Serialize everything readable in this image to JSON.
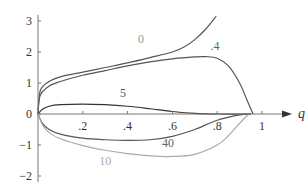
{
  "chart_data": {
    "type": "line",
    "title": "",
    "xlabel": "q",
    "ylabel": "",
    "xlim": [
      0,
      1.05
    ],
    "ylim": [
      -2.2,
      3.2
    ],
    "grid": false,
    "legend": "inline curve labels",
    "x_ticks": [
      ".2",
      ".4",
      ".6",
      ".8",
      "1"
    ],
    "y_ticks": [
      "3",
      "2",
      "1",
      "0",
      "−1",
      "−2"
    ],
    "series": [
      {
        "name": "0",
        "color": "#555555",
        "label_color": "#999999",
        "x": [
          0,
          0.01,
          0.05,
          0.1,
          0.2,
          0.3,
          0.4,
          0.5,
          0.6,
          0.65,
          0.7,
          0.75,
          0.8
        ],
        "y": [
          0,
          0.75,
          1.05,
          1.2,
          1.35,
          1.5,
          1.65,
          1.82,
          2.0,
          2.15,
          2.4,
          2.75,
          3.2
        ]
      },
      {
        "name": ".4",
        "color": "#555555",
        "label_color": "#666666",
        "x": [
          0,
          0.01,
          0.05,
          0.1,
          0.2,
          0.3,
          0.4,
          0.5,
          0.6,
          0.7,
          0.75,
          0.8,
          0.85,
          0.9,
          0.93,
          0.96
        ],
        "y": [
          0,
          0.6,
          0.9,
          1.05,
          1.25,
          1.4,
          1.55,
          1.68,
          1.78,
          1.84,
          1.85,
          1.8,
          1.55,
          1.0,
          0.5,
          0
        ]
      },
      {
        "name": "5",
        "color": "#333333",
        "label_color": "#555555",
        "x": [
          0,
          0.02,
          0.05,
          0.1,
          0.2,
          0.3,
          0.4,
          0.5,
          0.6,
          0.7,
          0.8,
          0.95
        ],
        "y": [
          0,
          0.15,
          0.25,
          0.3,
          0.32,
          0.3,
          0.25,
          0.17,
          0.08,
          0.02,
          0.0,
          0
        ]
      },
      {
        "name": "40",
        "color": "#555555",
        "label_color": "#666666",
        "x": [
          0,
          0.02,
          0.05,
          0.1,
          0.2,
          0.3,
          0.4,
          0.5,
          0.6,
          0.7,
          0.8,
          0.9,
          0.95
        ],
        "y": [
          0,
          -0.3,
          -0.5,
          -0.65,
          -0.78,
          -0.83,
          -0.85,
          -0.83,
          -0.72,
          -0.5,
          -0.2,
          -0.03,
          0
        ]
      },
      {
        "name": "10",
        "color": "#aaaaaa",
        "label_color": "#aaaaaa",
        "x": [
          0,
          0.02,
          0.05,
          0.1,
          0.2,
          0.3,
          0.4,
          0.5,
          0.6,
          0.7,
          0.8,
          0.85,
          0.9,
          0.94
        ],
        "y": [
          0,
          -0.35,
          -0.6,
          -0.8,
          -1.02,
          -1.17,
          -1.28,
          -1.35,
          -1.37,
          -1.3,
          -1.0,
          -0.7,
          -0.3,
          0
        ]
      }
    ],
    "annotations": [
      {
        "text": "0",
        "x": 0.46,
        "y": 2.3
      },
      {
        "text": ".4",
        "x": 0.79,
        "y": 2.05
      },
      {
        "text": "5",
        "x": 0.38,
        "y": 0.55
      },
      {
        "text": "40",
        "x": 0.58,
        "y": -1.05
      },
      {
        "text": "10",
        "x": 0.3,
        "y": -1.65
      }
    ]
  }
}
